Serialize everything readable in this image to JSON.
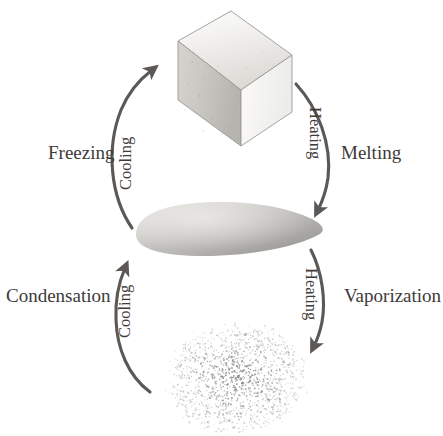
{
  "diagram": {
    "type": "cycle-diagram",
    "background_color": "#ffffff",
    "text_color": "#3e3a38",
    "arrow_color": "#5b5856",
    "states": [
      {
        "id": "solid",
        "name": "solid-block",
        "depiction": "grey 3D rectangular block (solid)",
        "fill_light": "#f2f1ef",
        "fill_mid": "#cfcdc9",
        "fill_dark": "#b9b7b2",
        "position": "top-center"
      },
      {
        "id": "liquid",
        "name": "liquid-blob",
        "depiction": "grey flattened lens-shaped puddle (liquid)",
        "fill_light": "#d7d6d3",
        "fill_dark": "#9d9c99",
        "position": "middle-center"
      },
      {
        "id": "gas",
        "name": "gas-particle-cloud",
        "depiction": "scattered cloud of tiny grey speckles (gas)",
        "particle_color": "#8d8b88",
        "particle_count": 1400,
        "position": "bottom-center"
      }
    ],
    "transitions": [
      {
        "id": "melting",
        "side_label": "Melting",
        "arc_label": "Heating",
        "from": "solid",
        "to": "liquid",
        "direction": "downward",
        "side": "right",
        "arc_label_orientation": "rotated-180"
      },
      {
        "id": "freezing",
        "side_label": "Freezing",
        "arc_label": "Cooling",
        "from": "liquid",
        "to": "solid",
        "direction": "upward",
        "side": "left",
        "arc_label_orientation": "rotated-90-ccw"
      },
      {
        "id": "vaporization",
        "side_label": "Vaporization",
        "arc_label": "Heating",
        "from": "liquid",
        "to": "gas",
        "direction": "downward",
        "side": "right",
        "arc_label_orientation": "rotated-180"
      },
      {
        "id": "condensation",
        "side_label": "Condensation",
        "arc_label": "Cooling",
        "from": "gas",
        "to": "liquid",
        "direction": "upward",
        "side": "left",
        "arc_label_orientation": "rotated-90-ccw"
      }
    ]
  }
}
